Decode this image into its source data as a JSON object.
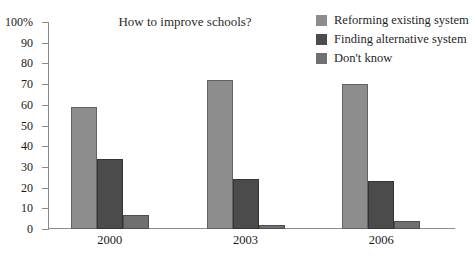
{
  "chart_data": {
    "type": "bar",
    "title": "How to improve schools?",
    "xlabel": "",
    "ylabel": "",
    "categories": [
      "2000",
      "2003",
      "2006"
    ],
    "ylim": [
      0,
      100
    ],
    "ytick_labels": [
      "100%",
      "90",
      "80",
      "70",
      "60",
      "50",
      "40",
      "30",
      "20",
      "10",
      "0"
    ],
    "ytick_values": [
      100,
      90,
      80,
      70,
      60,
      50,
      40,
      30,
      20,
      10,
      0
    ],
    "grid": false,
    "legend_position": "top-right",
    "units": "percent",
    "series": [
      {
        "name": "Reforming existing system",
        "color": "#8d8d8d",
        "values": [
          59,
          72,
          70
        ]
      },
      {
        "name": "Finding alternative system",
        "color": "#4b4b4b",
        "values": [
          34,
          24,
          23
        ]
      },
      {
        "name": "Don't know",
        "color": "#707070",
        "values": [
          7,
          2,
          4
        ]
      }
    ]
  },
  "axis": {
    "axis_color": "#8c8c8c"
  }
}
